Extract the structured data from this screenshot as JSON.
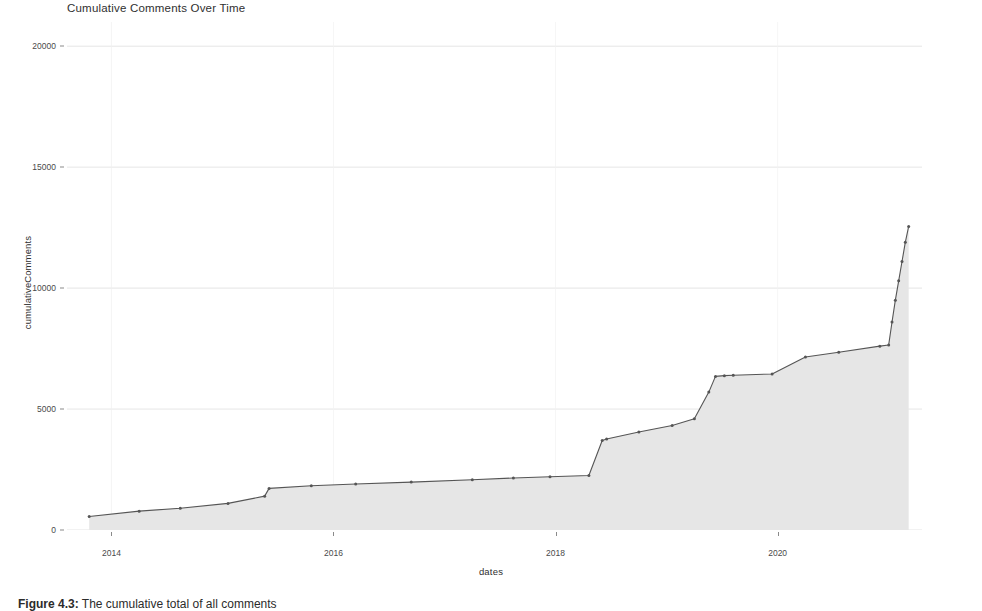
{
  "chart_data": {
    "type": "area",
    "title": "Cumulative Comments Over Time",
    "xlabel": "dates",
    "ylabel": "cumulativeComments",
    "xlim": [
      2013.6,
      2021.3
    ],
    "ylim": [
      0,
      21000
    ],
    "grid": true,
    "legend": null,
    "x_tick_labels": [
      "2014",
      "2016",
      "2018",
      "2020"
    ],
    "x_tick_values": [
      2014,
      2016,
      2018,
      2020
    ],
    "y_tick_labels": [
      "0",
      "5000",
      "10000",
      "15000",
      "20000"
    ],
    "y_tick_values": [
      0,
      5000,
      10000,
      15000,
      20000
    ],
    "series": [
      {
        "name": "cumulativeComments",
        "marker": "point",
        "fill": "#e6e6e6",
        "line_color": "#555555",
        "x": [
          2013.8,
          2014.25,
          2014.62,
          2015.05,
          2015.38,
          2015.42,
          2015.8,
          2016.2,
          2016.7,
          2017.25,
          2017.62,
          2017.95,
          2018.3,
          2018.42,
          2018.46,
          2018.75,
          2019.05,
          2019.25,
          2019.38,
          2019.44,
          2019.52,
          2019.6,
          2019.95,
          2020.25,
          2020.55,
          2020.92,
          2021.0,
          2021.03,
          2021.06,
          2021.09,
          2021.12,
          2021.15,
          2021.18
        ],
        "y": [
          560,
          780,
          900,
          1100,
          1400,
          1720,
          1830,
          1900,
          1980,
          2080,
          2150,
          2200,
          2250,
          3700,
          3760,
          4050,
          4320,
          4600,
          5700,
          6350,
          6380,
          6400,
          6450,
          7150,
          7350,
          7600,
          7650,
          8600,
          9500,
          10300,
          11100,
          11900,
          12550
        ]
      }
    ]
  },
  "caption": {
    "label": "Figure 4.3:",
    "text": "The cumulative total of all comments"
  }
}
